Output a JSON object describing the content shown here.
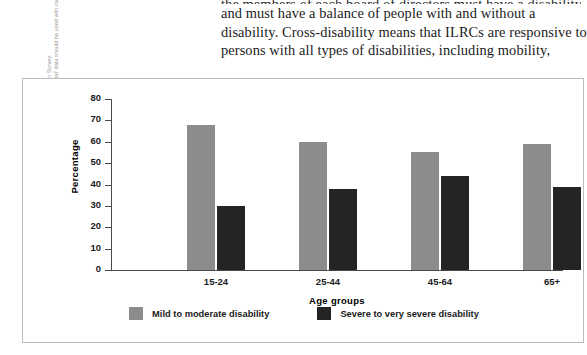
{
  "body_text": {
    "lines": [
      "the members of each board of directors must have a disability,",
      "and must have a balance of people with and without a",
      "disability. Cross-disability means that ILRCs are responsive to",
      "persons with all types of disabilities, including mobility,"
    ]
  },
  "source_note": {
    "lines": [
      "Source: Statistics Canada, 2001 Participation and Activity Limitation Survey.",
      "Excludes Yukon, Northwest Territories, and Nunavut. 'Developmental' data should be used with caution."
    ]
  },
  "legend": {
    "items": [
      {
        "label": "Mild to moderate disability",
        "color": "#8c8c8c"
      },
      {
        "label": "Severe to very severe disability",
        "color": "#242424"
      }
    ]
  },
  "chart_data": {
    "type": "bar",
    "title": "",
    "xlabel": "Age groups",
    "ylabel": "Percentage",
    "ylim": [
      0,
      80
    ],
    "yticks": [
      0,
      10,
      20,
      30,
      40,
      50,
      60,
      70,
      80
    ],
    "ytick_labels": [
      "0",
      "10",
      "20",
      "30",
      "40",
      "50",
      "60",
      "70",
      "80"
    ],
    "grid": false,
    "legend_position": "bottom",
    "categories": [
      "15-24",
      "25-44",
      "45-64",
      "65+"
    ],
    "series": [
      {
        "name": "Mild to moderate disability",
        "color": "#8c8c8c",
        "values": [
          68,
          60,
          55,
          59
        ]
      },
      {
        "name": "Severe to very severe disability",
        "color": "#242424",
        "values": [
          30,
          38,
          44,
          39
        ]
      }
    ]
  }
}
